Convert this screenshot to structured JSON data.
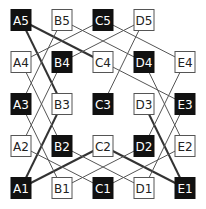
{
  "diagram": {
    "type": "grid-graph",
    "columns": [
      "A",
      "B",
      "C",
      "D",
      "E"
    ],
    "rows": [
      5,
      4,
      3,
      2,
      1
    ],
    "colors": {
      "filled": "#111111",
      "empty": "#ffffff",
      "border": "#555555",
      "edge_thin": "#555555",
      "edge_thick": "#333333"
    },
    "nodes": [
      {
        "id": "A5",
        "label": "A5",
        "col": 0,
        "row": 0,
        "filled": true
      },
      {
        "id": "B5",
        "label": "B5",
        "col": 1,
        "row": 0,
        "filled": false
      },
      {
        "id": "C5",
        "label": "C5",
        "col": 2,
        "row": 0,
        "filled": true
      },
      {
        "id": "D5",
        "label": "D5",
        "col": 3,
        "row": 0,
        "filled": false
      },
      {
        "id": "A4",
        "label": "A4",
        "col": 0,
        "row": 1,
        "filled": false
      },
      {
        "id": "B4",
        "label": "B4",
        "col": 1,
        "row": 1,
        "filled": true
      },
      {
        "id": "C4",
        "label": "C4",
        "col": 2,
        "row": 1,
        "filled": false
      },
      {
        "id": "D4",
        "label": "D4",
        "col": 3,
        "row": 1,
        "filled": true
      },
      {
        "id": "E4",
        "label": "E4",
        "col": 4,
        "row": 1,
        "filled": false
      },
      {
        "id": "A3",
        "label": "A3",
        "col": 0,
        "row": 2,
        "filled": true
      },
      {
        "id": "B3",
        "label": "B3",
        "col": 1,
        "row": 2,
        "filled": false
      },
      {
        "id": "C3",
        "label": "C3",
        "col": 2,
        "row": 2,
        "filled": true
      },
      {
        "id": "D3",
        "label": "D3",
        "col": 3,
        "row": 2,
        "filled": false
      },
      {
        "id": "E3",
        "label": "E3",
        "col": 4,
        "row": 2,
        "filled": true
      },
      {
        "id": "A2",
        "label": "A2",
        "col": 0,
        "row": 3,
        "filled": false
      },
      {
        "id": "B2",
        "label": "B2",
        "col": 1,
        "row": 3,
        "filled": true
      },
      {
        "id": "C2",
        "label": "C2",
        "col": 2,
        "row": 3,
        "filled": false
      },
      {
        "id": "D2",
        "label": "D2",
        "col": 3,
        "row": 3,
        "filled": true
      },
      {
        "id": "E2",
        "label": "E2",
        "col": 4,
        "row": 3,
        "filled": false
      },
      {
        "id": "A1",
        "label": "A1",
        "col": 0,
        "row": 4,
        "filled": true
      },
      {
        "id": "B1",
        "label": "B1",
        "col": 1,
        "row": 4,
        "filled": false
      },
      {
        "id": "C1",
        "label": "C1",
        "col": 2,
        "row": 4,
        "filled": true
      },
      {
        "id": "D1",
        "label": "D1",
        "col": 3,
        "row": 4,
        "filled": false
      },
      {
        "id": "E1",
        "label": "E1",
        "col": 4,
        "row": 4,
        "filled": true
      }
    ],
    "edges": [
      {
        "from": "A5",
        "to": "C4",
        "thick": true
      },
      {
        "from": "A5",
        "to": "B3",
        "thick": true
      },
      {
        "from": "B3",
        "to": "A1",
        "thick": true
      },
      {
        "from": "A1",
        "to": "C2",
        "thick": true
      },
      {
        "from": "C2",
        "to": "E1",
        "thick": true
      },
      {
        "from": "D3",
        "to": "E1",
        "thick": true
      },
      {
        "from": "B5",
        "to": "A3",
        "thick": false
      },
      {
        "from": "B5",
        "to": "D4",
        "thick": false
      },
      {
        "from": "C5",
        "to": "A4",
        "thick": false
      },
      {
        "from": "C5",
        "to": "E4",
        "thick": false
      },
      {
        "from": "D5",
        "to": "B4",
        "thick": false
      },
      {
        "from": "D5",
        "to": "C3",
        "thick": false
      },
      {
        "from": "C4",
        "to": "E3",
        "thick": false
      },
      {
        "from": "A4",
        "to": "B2",
        "thick": false
      },
      {
        "from": "B4",
        "to": "A2",
        "thick": false
      },
      {
        "from": "A3",
        "to": "B1",
        "thick": false
      },
      {
        "from": "A2",
        "to": "C1",
        "thick": false
      },
      {
        "from": "B1",
        "to": "D2",
        "thick": false
      },
      {
        "from": "B2",
        "to": "D1",
        "thick": false
      },
      {
        "from": "C1",
        "to": "E2",
        "thick": false
      },
      {
        "from": "D4",
        "to": "E2",
        "thick": false
      },
      {
        "from": "E4",
        "to": "D2",
        "thick": false
      },
      {
        "from": "E3",
        "to": "D1",
        "thick": false
      }
    ]
  }
}
